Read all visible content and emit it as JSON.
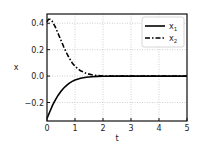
{
  "chart_data": {
    "type": "line",
    "title": "",
    "xlabel": "t",
    "ylabel": "x",
    "xlim": [
      0,
      5
    ],
    "ylim": [
      -0.34,
      0.47
    ],
    "xticks": [
      0,
      1,
      2,
      3,
      4,
      5
    ],
    "xtick_labels": [
      "0",
      "1",
      "2",
      "3",
      "4",
      "5"
    ],
    "yticks": [
      -0.2,
      0.0,
      0.2,
      0.4
    ],
    "ytick_labels": [
      "−0.2",
      "0.0",
      "0.2",
      "0.4"
    ],
    "grid": true,
    "legend_position": "upper right",
    "series": [
      {
        "name": "x1",
        "label_main": "x",
        "label_sub": "1",
        "style": "solid",
        "color": "#000000",
        "x": [
          0,
          0.1,
          0.2,
          0.3,
          0.4,
          0.5,
          0.6,
          0.7,
          0.8,
          0.9,
          1.0,
          1.2,
          1.4,
          1.6,
          1.8,
          2.0,
          2.5,
          3.0,
          4.0,
          5.0
        ],
        "y": [
          -0.32,
          -0.27,
          -0.22,
          -0.18,
          -0.145,
          -0.115,
          -0.09,
          -0.07,
          -0.053,
          -0.04,
          -0.03,
          -0.017,
          -0.009,
          -0.005,
          -0.002,
          -0.001,
          0.0,
          0.0,
          0.0,
          0.0
        ]
      },
      {
        "name": "x2",
        "label_main": "x",
        "label_sub": "2",
        "style": "dashdot",
        "color": "#000000",
        "x": [
          0,
          0.05,
          0.1,
          0.15,
          0.2,
          0.3,
          0.4,
          0.5,
          0.6,
          0.7,
          0.8,
          0.9,
          1.0,
          1.2,
          1.4,
          1.6,
          1.8,
          2.0,
          2.5,
          3.0,
          4.0,
          5.0
        ],
        "y": [
          0.41,
          0.43,
          0.43,
          0.425,
          0.41,
          0.37,
          0.32,
          0.27,
          0.22,
          0.175,
          0.135,
          0.1,
          0.075,
          0.04,
          0.02,
          0.01,
          0.004,
          0.001,
          0.0,
          0.0,
          0.0,
          0.0
        ]
      }
    ]
  }
}
